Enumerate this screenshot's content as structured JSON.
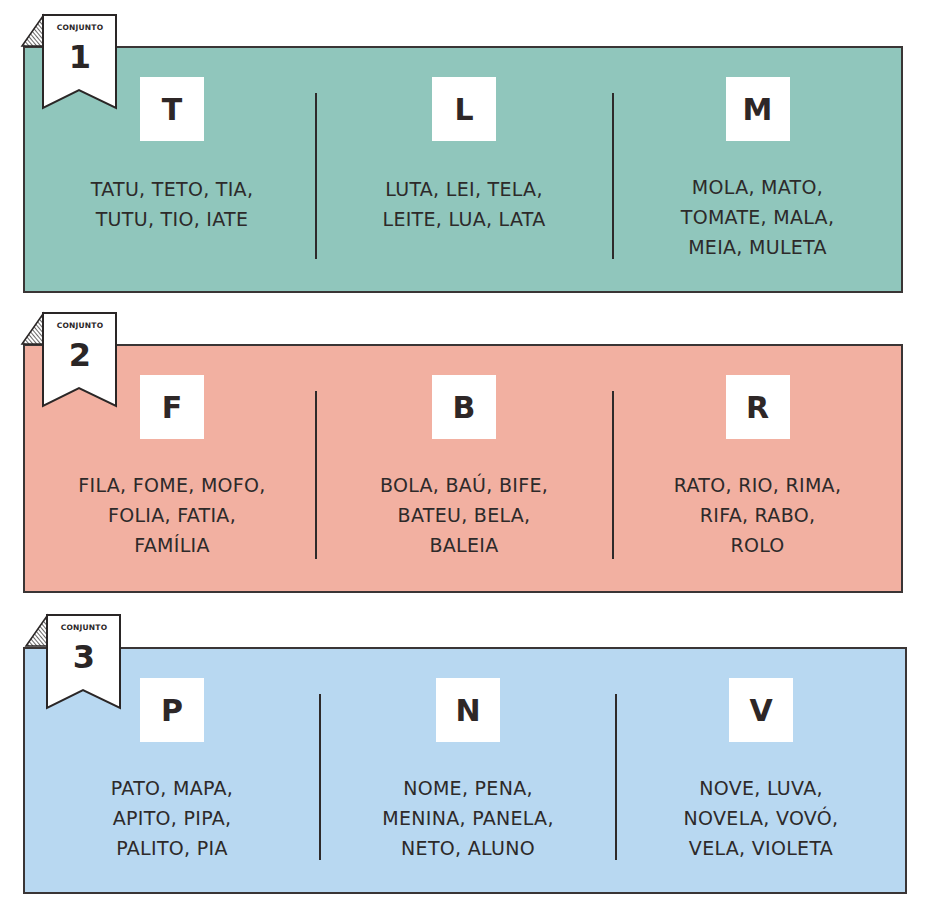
{
  "colors": {
    "set1_bg": "#90c6bc",
    "set2_bg": "#f2b0a1",
    "set3_bg": "#b8d8f1",
    "border": "#3a3535",
    "letter_box_bg": "#ffffff",
    "text": "#2d2a2a"
  },
  "sets": [
    {
      "label": "CONJUNTO",
      "number": "1",
      "groups": [
        {
          "letter": "T",
          "lines": [
            "TATU, TETO, TIA,",
            "TUTU, TIO, IATE"
          ]
        },
        {
          "letter": "L",
          "lines": [
            "LUTA, LEI, TELA,",
            "LEITE, LUA, LATA"
          ]
        },
        {
          "letter": "M",
          "lines": [
            "MOLA, MATO,",
            "TOMATE, MALA,",
            "MEIA, MULETA"
          ]
        }
      ]
    },
    {
      "label": "CONJUNTO",
      "number": "2",
      "groups": [
        {
          "letter": "F",
          "lines": [
            "FILA, FOME, MOFO,",
            "FOLIA, FATIA,",
            "FAMÍLIA"
          ]
        },
        {
          "letter": "B",
          "lines": [
            "BOLA, BAÚ, BIFE,",
            "BATEU, BELA,",
            "BALEIA"
          ]
        },
        {
          "letter": "R",
          "lines": [
            "RATO, RIO, RIMA,",
            "RIFA, RABO,",
            "ROLO"
          ]
        }
      ]
    },
    {
      "label": "CONJUNTO",
      "number": "3",
      "groups": [
        {
          "letter": "P",
          "lines": [
            "PATO, MAPA,",
            "APITO, PIPA,",
            "PALITO, PIA"
          ]
        },
        {
          "letter": "N",
          "lines": [
            "NOME, PENA,",
            "MENINA, PANELA,",
            "NETO, ALUNO"
          ]
        },
        {
          "letter": "V",
          "lines": [
            "NOVE, LUVA,",
            "NOVELA, VOVÓ,",
            "VELA, VIOLETA"
          ]
        }
      ]
    }
  ]
}
